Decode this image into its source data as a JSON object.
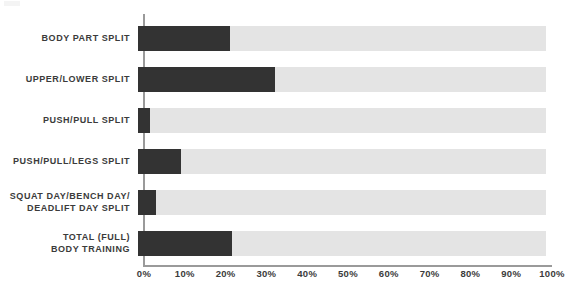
{
  "chart_data": {
    "type": "bar",
    "orientation": "horizontal",
    "title": "",
    "subtitle": "",
    "xlabel": "",
    "ylabel": "",
    "xlim": [
      0,
      100
    ],
    "ylim": null,
    "grid": false,
    "legend": null,
    "value_suffix": "%",
    "categories": [
      "BODY PART SPLIT",
      "UPPER/LOWER SPLIT",
      "PUSH/PULL SPLIT",
      "PUSH/PULL/LEGS SPLIT",
      "SQUAT DAY/BENCH DAY/\nDEADLIFT DAY SPLIT",
      "TOTAL (FULL)\nBODY TRAINING"
    ],
    "values": [
      22.5,
      33.5,
      3,
      10.5,
      4.5,
      23
    ],
    "tick_labels": [
      "0%",
      "10%",
      "20%",
      "30%",
      "40%",
      "50%",
      "60%",
      "70%",
      "80%",
      "90%",
      "100%"
    ],
    "tick_values": [
      0,
      10,
      20,
      30,
      40,
      50,
      60,
      70,
      80,
      90,
      100
    ],
    "colors": {
      "bar_fill": "#333333",
      "bar_track": "#e4e4e4",
      "axis": "#9a9a9a",
      "text": "#3b3b3b",
      "background": "#ffffff"
    }
  }
}
